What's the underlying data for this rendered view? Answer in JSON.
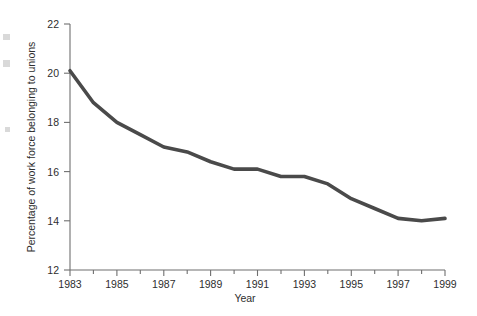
{
  "chart_data": {
    "type": "line",
    "title": "",
    "xlabel": "Year",
    "ylabel": "Percentage of work force belonging to unions",
    "xlim": [
      1983,
      1999
    ],
    "ylim": [
      12,
      22
    ],
    "grid": false,
    "legend": null,
    "y_ticks": [
      12,
      14,
      16,
      18,
      20,
      22
    ],
    "y_tick_labels": [
      "12",
      "14",
      "16",
      "18",
      "20",
      "22"
    ],
    "x_ticks": [
      1983,
      1984,
      1985,
      1986,
      1987,
      1988,
      1989,
      1990,
      1991,
      1992,
      1993,
      1994,
      1995,
      1996,
      1997,
      1998,
      1999
    ],
    "x_tick_labels": [
      "1983",
      "",
      "1985",
      "",
      "1987",
      "",
      "1989",
      "",
      "1991",
      "",
      "1993",
      "",
      "1995",
      "",
      "1997",
      "",
      "1999"
    ],
    "x_major_labels": [
      "1983",
      "1985",
      "1987",
      "1989",
      "1991",
      "1993",
      "1995",
      "1997",
      "1999"
    ],
    "series": [
      {
        "name": "Percentage of work force belonging to unions",
        "color": "#4a4a4a",
        "x": [
          1983,
          1984,
          1985,
          1986,
          1987,
          1988,
          1989,
          1990,
          1991,
          1992,
          1993,
          1994,
          1995,
          1996,
          1997,
          1998,
          1999
        ],
        "values": [
          20.1,
          18.8,
          18.0,
          17.5,
          17.0,
          16.8,
          16.4,
          16.1,
          16.1,
          15.8,
          15.8,
          15.5,
          14.9,
          14.5,
          14.1,
          14.0,
          14.1
        ]
      }
    ]
  },
  "axes": {
    "y_label": "Percentage of work force belonging to unions",
    "x_label": "Year"
  }
}
